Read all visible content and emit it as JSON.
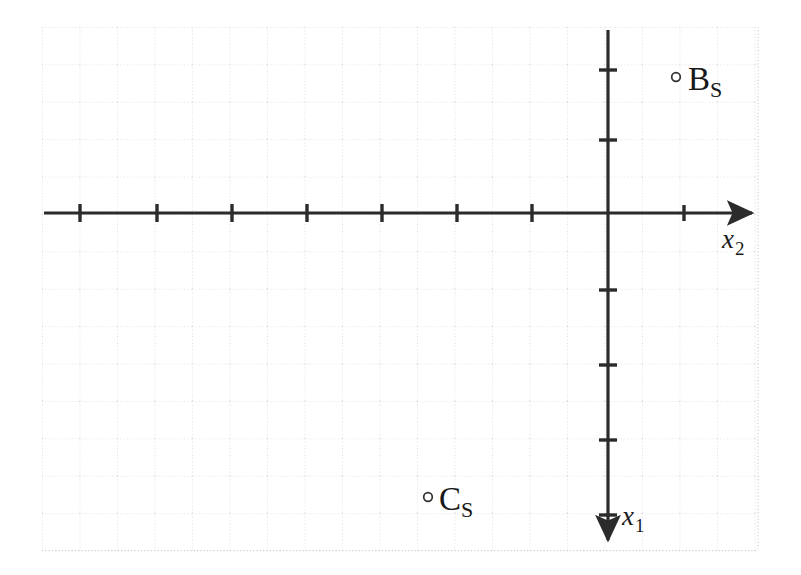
{
  "figure": {
    "type": "coordinate-axes-diagram",
    "width": 801,
    "height": 575,
    "background_color": "#ffffff",
    "axis_color": "#2b2b2b",
    "grid_color": "#c9c9c9",
    "label_color": "#181818"
  },
  "grid": {
    "style": "dotted",
    "cell_size_px": 37.5,
    "left_px": 42,
    "top_px": 27,
    "right_px": 758,
    "bottom_px": 550,
    "columns": 19,
    "rows": 14,
    "visible": true
  },
  "axes": {
    "horizontal": {
      "name": "x2-axis",
      "label": "x",
      "subscript": "2",
      "label_full": "x 2",
      "orientation": "horizontal",
      "arrow_direction": "right",
      "start_px": [
        44,
        213
      ],
      "end_px": [
        757,
        213
      ],
      "tick_spacing_px": 75,
      "tick_positions_px": [
        80,
        157,
        232,
        307,
        382,
        457,
        532,
        684
      ],
      "label_position_px": [
        722,
        228
      ]
    },
    "vertical": {
      "name": "x1-axis",
      "label": "x",
      "subscript": "1",
      "label_full": "x 1",
      "orientation": "vertical",
      "arrow_direction": "down",
      "start_px": [
        608,
        30
      ],
      "end_px": [
        608,
        545
      ],
      "tick_spacing_px": 75,
      "tick_positions_px": [
        70,
        140,
        290,
        365,
        440,
        515
      ],
      "label_position_px": [
        622,
        505
      ]
    },
    "origin_px": [
      608,
      213
    ]
  },
  "points": [
    {
      "name": "point-b-s",
      "label": "B",
      "subscript": "S",
      "label_full": "B S",
      "marker": "open-circle",
      "marker_px": [
        676,
        77
      ],
      "label_px": [
        688,
        62
      ]
    },
    {
      "name": "point-c-s",
      "label": "C",
      "subscript": "S",
      "label_full": "C S",
      "marker": "open-circle",
      "marker_px": [
        428,
        497
      ],
      "label_px": [
        439,
        483
      ]
    }
  ]
}
